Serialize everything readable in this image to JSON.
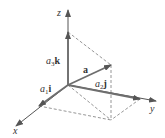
{
  "diagram": {
    "colors": {
      "axis": "#555555",
      "vector": "#6e6e6e",
      "dashed": "#8a8a8a",
      "text": "#333333"
    },
    "axes": {
      "x": {
        "label": "x"
      },
      "y": {
        "label": "y"
      },
      "z": {
        "label": "z"
      }
    },
    "vectors": {
      "a": {
        "label": "a"
      },
      "a1i": {
        "coef": "a",
        "sub": "1",
        "unit": "i"
      },
      "a2j": {
        "coef": "a",
        "sub": "2",
        "unit": "j"
      },
      "a3k": {
        "coef": "a",
        "sub": "3",
        "unit": "k"
      }
    }
  }
}
